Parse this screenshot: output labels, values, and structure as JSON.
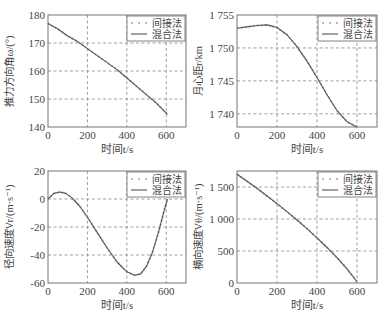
{
  "legend": {
    "dotted_label": "间接法",
    "solid_label": "混合法"
  },
  "colors": {
    "line": "#555555",
    "dots": "#bbbbbb",
    "grid": "#777777",
    "axes": "#666666"
  },
  "chart_data": [
    {
      "type": "line",
      "title": "",
      "xlabel": "时间t/s",
      "ylabel": "推力方向角ω/(°)",
      "xlim": [
        0,
        700
      ],
      "ylim": [
        140,
        180
      ],
      "xticks": [
        0,
        200,
        400,
        600
      ],
      "xtick_labels": [
        "0",
        "200",
        "400",
        "600"
      ],
      "yticks": [
        140,
        150,
        160,
        170,
        180
      ],
      "ytick_labels": [
        "140",
        "150",
        "160",
        "170",
        "180"
      ],
      "grid": true,
      "legend_position": "upper right",
      "x": [
        0,
        50,
        100,
        150,
        200,
        250,
        300,
        350,
        400,
        450,
        500,
        550,
        606
      ],
      "series": [
        {
          "name": "间接法",
          "style": "dotted",
          "values": [
            177,
            175,
            172.5,
            170.5,
            168,
            165.5,
            163,
            160.5,
            157.5,
            154.5,
            151.5,
            148.5,
            144.5
          ]
        },
        {
          "name": "混合法",
          "style": "solid",
          "values": [
            177,
            175,
            172.5,
            170.5,
            168,
            165.5,
            163,
            160.5,
            157.5,
            154.5,
            151.5,
            148.5,
            144.5
          ]
        }
      ]
    },
    {
      "type": "line",
      "title": "",
      "xlabel": "时间t/s",
      "ylabel": "月心距r/km",
      "xlim": [
        0,
        700
      ],
      "ylim": [
        1738,
        1755
      ],
      "xticks": [
        0,
        200,
        400,
        600
      ],
      "xtick_labels": [
        "0",
        "200",
        "400",
        "600"
      ],
      "yticks": [
        1740,
        1745,
        1750,
        1755
      ],
      "ytick_labels": [
        "1 740",
        "1 745",
        "1 750",
        "1 755"
      ],
      "grid": true,
      "legend_position": "upper right",
      "x": [
        0,
        50,
        100,
        150,
        200,
        250,
        300,
        350,
        400,
        450,
        500,
        550,
        600
      ],
      "series": [
        {
          "name": "间接法",
          "style": "dotted",
          "values": [
            1753.0,
            1753.2,
            1753.4,
            1753.5,
            1753.1,
            1752.0,
            1750.2,
            1748.0,
            1745.5,
            1742.9,
            1740.5,
            1738.8,
            1738.0
          ]
        },
        {
          "name": "混合法",
          "style": "solid",
          "values": [
            1753.0,
            1753.2,
            1753.4,
            1753.5,
            1753.1,
            1752.0,
            1750.2,
            1748.0,
            1745.5,
            1742.9,
            1740.5,
            1738.8,
            1738.0
          ]
        }
      ]
    },
    {
      "type": "line",
      "title": "",
      "xlabel": "时间t/s",
      "ylabel": "径向速度Vr/(m·s⁻¹)",
      "xlim": [
        0,
        700
      ],
      "ylim": [
        -60,
        20
      ],
      "xticks": [
        0,
        200,
        400,
        600
      ],
      "xtick_labels": [
        "0",
        "200",
        "400",
        "600"
      ],
      "yticks": [
        -60,
        -40,
        -20,
        0,
        20
      ],
      "ytick_labels": [
        "-60",
        "-40",
        "-20",
        "0",
        "20"
      ],
      "grid": true,
      "legend_position": "upper right",
      "x": [
        0,
        30,
        60,
        90,
        120,
        160,
        200,
        250,
        300,
        350,
        400,
        440,
        470,
        500,
        530,
        560,
        590,
        606
      ],
      "series": [
        {
          "name": "间接法",
          "style": "dotted",
          "values": [
            0,
            4,
            5,
            4,
            1,
            -5,
            -13,
            -24,
            -35,
            -45,
            -52,
            -54.5,
            -53.5,
            -48,
            -38,
            -24,
            -8,
            0
          ]
        },
        {
          "name": "混合法",
          "style": "solid",
          "values": [
            0,
            4,
            5,
            4,
            1,
            -5,
            -13,
            -24,
            -35,
            -45,
            -52,
            -54.5,
            -53.5,
            -48,
            -38,
            -24,
            -8,
            0
          ]
        }
      ]
    },
    {
      "type": "line",
      "title": "",
      "xlabel": "时间t/s",
      "ylabel": "横向速度Vθ/(m·s⁻¹)",
      "xlim": [
        0,
        700
      ],
      "ylim": [
        0,
        1750
      ],
      "xticks": [
        0,
        200,
        400,
        600
      ],
      "xtick_labels": [
        "0",
        "200",
        "400",
        "600"
      ],
      "yticks": [
        0,
        500,
        1000,
        1500
      ],
      "ytick_labels": [
        "0",
        "500",
        "1 000",
        "1 500"
      ],
      "grid": true,
      "legend_position": "upper right",
      "x": [
        0,
        50,
        100,
        150,
        200,
        250,
        300,
        350,
        400,
        450,
        500,
        550,
        600
      ],
      "series": [
        {
          "name": "间接法",
          "style": "dotted",
          "values": [
            1700,
            1590,
            1480,
            1360,
            1240,
            1115,
            985,
            850,
            705,
            555,
            395,
            220,
            20
          ]
        },
        {
          "name": "混合法",
          "style": "solid",
          "values": [
            1700,
            1590,
            1480,
            1360,
            1240,
            1115,
            985,
            850,
            705,
            555,
            395,
            220,
            20
          ]
        }
      ]
    }
  ]
}
